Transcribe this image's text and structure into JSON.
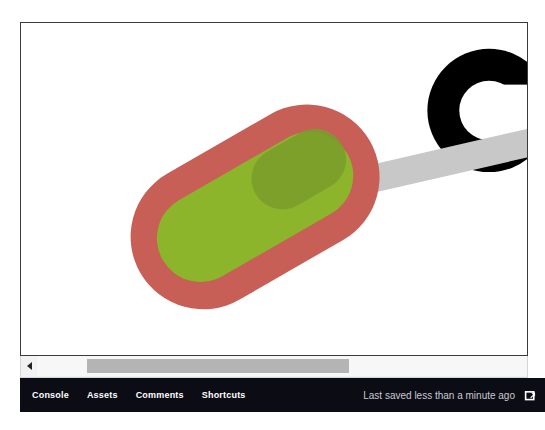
{
  "app": {
    "background": "#ffffff",
    "canvas_background": "#ffffff",
    "canvas_border_color": "#3a3a3a"
  },
  "canvas": {
    "name": "design-canvas",
    "shapes": [
      {
        "id": "black-ring",
        "type": "ring",
        "color": "#000000",
        "cx": 490,
        "cy": 88,
        "outer_r": 62,
        "inner_r": 30,
        "note": "thick C-shaped ring clipped by right canvas edge"
      },
      {
        "id": "gray-bar",
        "type": "rect",
        "color": "#c8c8c8",
        "x": 330,
        "y": 155,
        "width": 260,
        "height": 28,
        "rotation": -13
      },
      {
        "id": "red-pill",
        "type": "rounded-rect",
        "color": "#c75f57",
        "x": 122,
        "y": 117,
        "width": 266,
        "height": 146,
        "radius": 73,
        "rotation": -30
      },
      {
        "id": "green-pill",
        "type": "rounded-rect",
        "color": "#8cb52b",
        "x": 148,
        "y": 146,
        "width": 214,
        "height": 88,
        "radius": 44,
        "rotation": -30
      },
      {
        "id": "olive-overlay",
        "type": "rounded-rect",
        "color": "#7a9c2c",
        "opacity": 0.85,
        "x": 262,
        "y": 148,
        "width": 100,
        "height": 62,
        "radius": 31,
        "rotation": -30
      }
    ]
  },
  "scrollbar": {
    "name": "horizontal-scrollbar",
    "arrow_left_icon": "triangle-left-icon",
    "thumb_color": "#b4b4b4",
    "track_color": "#f7f7f7",
    "thumb_left": 50,
    "thumb_width": 262
  },
  "statusbar": {
    "background": "#0c0c14",
    "menu": [
      {
        "label": "Console",
        "name": "status-menu-console"
      },
      {
        "label": "Assets",
        "name": "status-menu-assets"
      },
      {
        "label": "Comments",
        "name": "status-menu-comments"
      },
      {
        "label": "Shortcuts",
        "name": "status-menu-shortcuts"
      }
    ],
    "saved_status": "Last saved less than a minute ago",
    "saved_status_color": "#c9c9d2",
    "external_link_icon": "external-link-icon"
  }
}
